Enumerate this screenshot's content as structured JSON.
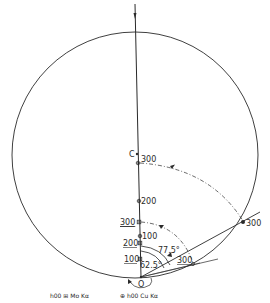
{
  "diagram": {
    "type": "ewald-sphere-construction",
    "origin_label": "O",
    "center_label": "C",
    "angles": {
      "inner": "62.5°",
      "outer": "77.5°"
    },
    "cu_points": [
      {
        "label": "100",
        "underlined": false
      },
      {
        "label": "200",
        "underlined": false
      },
      {
        "label": "300",
        "underlined": false
      }
    ],
    "mo_points": [
      {
        "label": "100",
        "underlined": true
      },
      {
        "label": "200",
        "underlined": true
      },
      {
        "label": "300",
        "underlined": true
      }
    ],
    "rotated_cu_label": "300",
    "rotated_mo_label": "300",
    "legend": {
      "mo": {
        "symbol": "⊞",
        "text": "h00 ⊞ Mo Kα"
      },
      "cu": {
        "symbol": "⊕",
        "text": "⊕ h00 Cu Kα"
      }
    },
    "colors": {
      "ink": "#2a2a2a",
      "background": "#ffffff"
    }
  }
}
